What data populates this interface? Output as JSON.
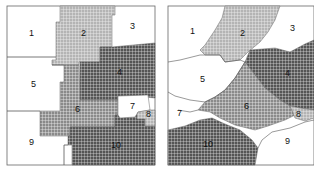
{
  "figure": {
    "panels": [
      {
        "id": "left",
        "description": "rectangular grid-aligned partition",
        "regions": [
          {
            "label": "1",
            "fill": "white"
          },
          {
            "label": "2",
            "fill": "light-grid"
          },
          {
            "label": "3",
            "fill": "white"
          },
          {
            "label": "4",
            "fill": "dark-grid"
          },
          {
            "label": "5",
            "fill": "white"
          },
          {
            "label": "6",
            "fill": "medium-grid"
          },
          {
            "label": "7",
            "fill": "white"
          },
          {
            "label": "8",
            "fill": "light-grid"
          },
          {
            "label": "9",
            "fill": "white"
          },
          {
            "label": "10",
            "fill": "dark-grid"
          }
        ]
      },
      {
        "id": "right",
        "description": "diagonal staircase partition",
        "regions": [
          {
            "label": "1",
            "fill": "white"
          },
          {
            "label": "2",
            "fill": "light-grid"
          },
          {
            "label": "3",
            "fill": "white"
          },
          {
            "label": "4",
            "fill": "dark-grid"
          },
          {
            "label": "5",
            "fill": "white"
          },
          {
            "label": "6",
            "fill": "medium-grid"
          },
          {
            "label": "7",
            "fill": "white"
          },
          {
            "label": "8",
            "fill": "light-grid"
          },
          {
            "label": "9",
            "fill": "white"
          },
          {
            "label": "10",
            "fill": "dark-grid"
          }
        ]
      }
    ],
    "colors": {
      "outline": "#555555",
      "light_grid_bg": "#b8b8b8",
      "medium_grid_bg": "#8a8a8a",
      "dark_grid_bg": "#5a5a5a",
      "grid_line": "#f2f2f2"
    }
  }
}
